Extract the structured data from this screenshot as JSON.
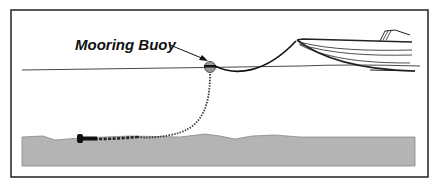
{
  "diagram": {
    "labels": {
      "buoy": "Mooring Buoy"
    },
    "elements": [
      "boat",
      "mooring-buoy",
      "pennant-line",
      "mooring-chain",
      "anchor",
      "sea-bed",
      "water-line"
    ],
    "colors": {
      "seabed": "#b4b4b4",
      "outline": "#222222",
      "buoy": "#9a9a9a"
    }
  }
}
